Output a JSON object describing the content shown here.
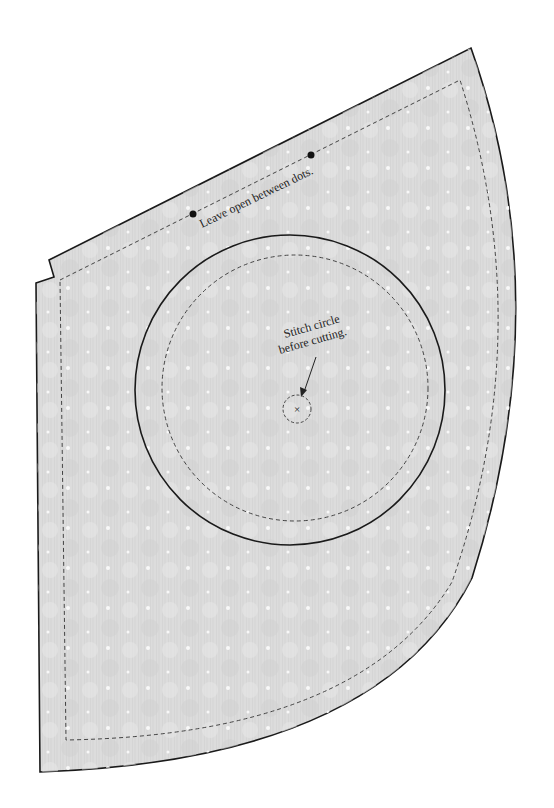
{
  "pattern": {
    "piece": "cone-shaped pattern piece",
    "fabric_fill": "#d9d9d9",
    "fabric_texture": "#cfcfcf",
    "outline_color": "#1a1a1a",
    "stitch_color": "#444444"
  },
  "annotations": {
    "leave_open": "Leave open between dots.",
    "stitch_circle_line1": "Stitch circle",
    "stitch_circle_line2": "before cutting.",
    "center_mark": "×"
  }
}
